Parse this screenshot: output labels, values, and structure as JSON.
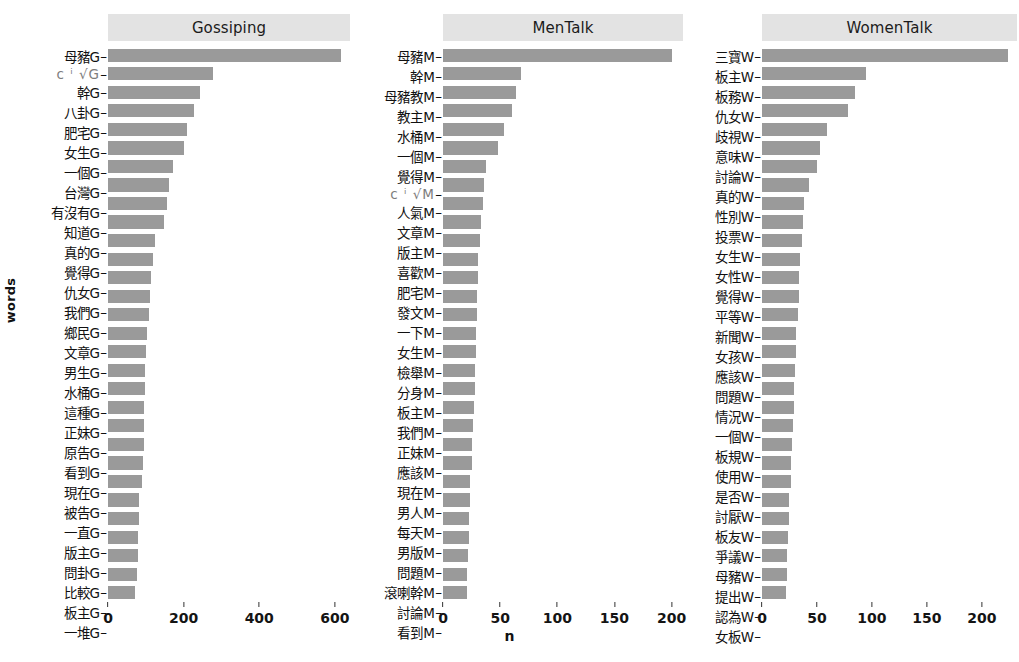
{
  "axis": {
    "y_title": "words",
    "x_title": "n"
  },
  "style": {
    "bar_color": "#9a9a9a",
    "strip_color": "#e3e3e3",
    "panel_color": "#ffffff",
    "text_color": "#101010"
  },
  "chart_data": {
    "type": "bar",
    "orientation": "horizontal",
    "title": "",
    "xlabel": "n",
    "ylabel": "words",
    "grid": false,
    "legend": "none",
    "facets": [
      {
        "name": "Gossiping",
        "xlim": [
          0,
          640
        ],
        "xticks": [
          0,
          200,
          400,
          600
        ],
        "categories": [
          "母豬G",
          "仇女G",
          "幹G",
          "八卦G",
          "肥宅G",
          "女生G",
          "一個G",
          "台灣G",
          "有沒有G",
          "知道G",
          "真的G",
          "覺得G",
          "仇女G",
          "我們G",
          "鄉民G",
          "文章G",
          "男生G",
          "水桶G",
          "這種G",
          "正妹G",
          "原告G",
          "看到G",
          "現在G",
          "被告G",
          "一直G",
          "版主G",
          "問卦G",
          "比較G",
          "板主G",
          "一堆G"
        ],
        "values": [
          616,
          278,
          243,
          228,
          208,
          202,
          172,
          162,
          155,
          148,
          123,
          120,
          113,
          110,
          108,
          103,
          100,
          99,
          97,
          96,
          95,
          94,
          92,
          90,
          83,
          82,
          80,
          79,
          76,
          72
        ],
        "obscured_label_index": 1
      },
      {
        "name": "MenTalk",
        "xlim": [
          0,
          210
        ],
        "xticks": [
          0,
          50,
          100,
          150,
          200
        ],
        "categories": [
          "母豬M",
          "幹M",
          "母豬教M",
          "教主M",
          "水桶M",
          "一個M",
          "覺得M",
          "仇女M",
          "人氣M",
          "文章M",
          "版主M",
          "喜歡M",
          "肥宅M",
          "發文M",
          "一下M",
          "女生M",
          "檢舉M",
          "分身M",
          "板主M",
          "我們M",
          "正妹M",
          "應該M",
          "現在M",
          "男人M",
          "每天M",
          "男版M",
          "問題M",
          "滾喇幹M",
          "討論M",
          "看到M"
        ],
        "values": [
          200,
          68,
          64,
          60,
          53,
          48,
          38,
          36,
          35,
          33,
          32,
          31,
          31,
          30,
          30,
          29,
          29,
          28,
          28,
          27,
          26,
          25,
          25,
          24,
          24,
          23,
          23,
          22,
          21,
          21
        ],
        "obscured_label_index": 7
      },
      {
        "name": "WomenTalk",
        "xlim": [
          0,
          232
        ],
        "xticks": [
          0,
          50,
          100,
          150,
          200
        ],
        "categories": [
          "三寶W",
          "板主W",
          "板務W",
          "仇女W",
          "歧視W",
          "意味W",
          "討論W",
          "真的W",
          "性別W",
          "投票W",
          "女生W",
          "女性W",
          "覺得W",
          "平等W",
          "新聞W",
          "女孩W",
          "應該W",
          "問題W",
          "情況W",
          "一個W",
          "板規W",
          "使用W",
          "是否W",
          "討厭W",
          "板友W",
          "爭議W",
          "母豬W",
          "提出W",
          "認為W",
          "女板W"
        ],
        "values": [
          224,
          95,
          85,
          78,
          59,
          53,
          50,
          43,
          38,
          37,
          36,
          35,
          34,
          34,
          33,
          31,
          31,
          30,
          29,
          29,
          28,
          27,
          26,
          26,
          25,
          25,
          24,
          23,
          23,
          22
        ],
        "obscured_label_index": -1
      }
    ]
  }
}
